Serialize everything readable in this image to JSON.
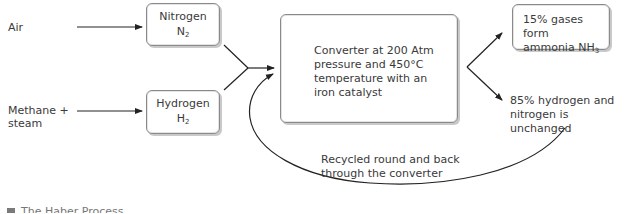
{
  "inputs": {
    "air": "Air",
    "methane": "Methane +",
    "methane_line2": "steam"
  },
  "boxes": {
    "nitrogen": {
      "name": "Nitrogen",
      "formula_base": "N",
      "formula_sub": "2"
    },
    "hydrogen": {
      "name": "Hydrogen",
      "formula_base": "H",
      "formula_sub": "2"
    },
    "converter": {
      "line1": "Converter at 200 Atm",
      "line2": "pressure and 450°C",
      "line3": "temperature with an",
      "line4": "iron catalyst"
    },
    "ammonia": {
      "line1": "15% gases form",
      "line2_prefix": "ammonia NH",
      "line2_sub": "3"
    }
  },
  "outputs": {
    "unchanged_line1": "85% hydrogen and",
    "unchanged_line2": "nitrogen is unchanged"
  },
  "recycle": {
    "line1": "Recycled round and back",
    "line2": "through the converter"
  },
  "caption": {
    "text": "The Haber Process",
    "marker_icon": "square-marker-icon"
  },
  "colors": {
    "line": "#222222",
    "box_border": "#8a8a8a",
    "text": "#3a3a3a"
  }
}
